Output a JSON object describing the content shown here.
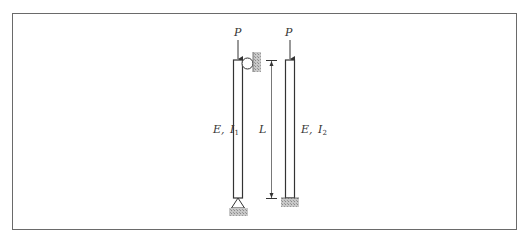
{
  "figure": {
    "load_label": "P",
    "length_label": "L",
    "left_column": {
      "label_E": "E,",
      "label_I": "I",
      "label_sub": "1",
      "top_support": "roller-against-wall",
      "bottom_support": "pin"
    },
    "right_column": {
      "label_E": "E,",
      "label_I": "I",
      "label_sub": "2",
      "top_support": "free",
      "bottom_support": "fixed"
    },
    "colors": {
      "line": "#333333",
      "hatch": "#9a9a9a",
      "frame": "#6a6a6a"
    }
  }
}
